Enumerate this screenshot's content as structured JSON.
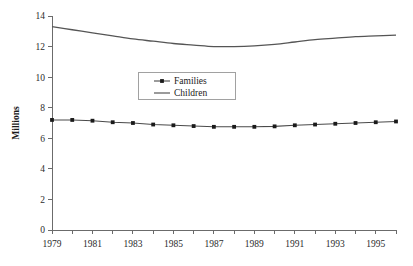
{
  "chart_data": {
    "type": "line",
    "title": "",
    "subtitle": "",
    "xlabel": "",
    "ylabel": "Millions",
    "xlim": [
      1979,
      1996
    ],
    "ylim": [
      0,
      14
    ],
    "grid": false,
    "legend_position": "upper-center",
    "x": [
      1979,
      1980,
      1981,
      1982,
      1983,
      1984,
      1985,
      1986,
      1987,
      1988,
      1989,
      1990,
      1991,
      1992,
      1993,
      1994,
      1995,
      1996
    ],
    "x_tick_labels": [
      "1979",
      "1981",
      "1983",
      "1985",
      "1987",
      "1989",
      "1991",
      "1993",
      "1995"
    ],
    "x_tick_values": [
      1979,
      1981,
      1983,
      1985,
      1987,
      1989,
      1991,
      1993,
      1995
    ],
    "y_tick_labels": [
      "0",
      "2",
      "4",
      "6",
      "8",
      "10",
      "12",
      "14"
    ],
    "y_tick_values": [
      0,
      2,
      4,
      6,
      8,
      10,
      12,
      14
    ],
    "series": [
      {
        "name": "Families",
        "marker": "square",
        "color": "#4a4a4a",
        "values": [
          7.2,
          7.2,
          7.15,
          7.05,
          7.0,
          6.9,
          6.85,
          6.8,
          6.75,
          6.75,
          6.75,
          6.78,
          6.85,
          6.9,
          6.95,
          7.0,
          7.05,
          7.1
        ]
      },
      {
        "name": "Children",
        "marker": "none",
        "color": "#555555",
        "values": [
          13.3,
          13.1,
          12.9,
          12.7,
          12.5,
          12.35,
          12.2,
          12.1,
          12.0,
          12.0,
          12.05,
          12.15,
          12.3,
          12.45,
          12.55,
          12.65,
          12.7,
          12.75
        ]
      }
    ]
  },
  "legend": {
    "items": [
      {
        "label": "Families"
      },
      {
        "label": "Children"
      }
    ]
  },
  "axes": {
    "y_title": "Millions"
  }
}
